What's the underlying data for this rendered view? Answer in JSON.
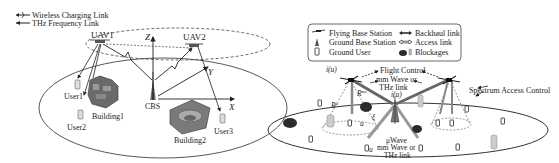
{
  "left_panel": {
    "legend": {
      "wireless_charging": "Wireless Charging Link",
      "thz_frequency": "THz Frequency Link"
    },
    "nodes": {
      "uav1": "UAV1",
      "uav2": "UAV2",
      "cbs": "CBS",
      "user1": "User1",
      "user2": "User2",
      "user3": "User3",
      "building1": "Building1",
      "building2": "Building2"
    },
    "axes": {
      "x": "X",
      "y": "Y",
      "z": "Z"
    }
  },
  "right_panel": {
    "legend": {
      "flying_base_station": "Flying Base Station",
      "ground_base_station": "Ground Base Station",
      "ground_user": "Ground User",
      "backhaul_link": "Backhaul link",
      "access_link": "Access link",
      "blockages": "Blockages"
    },
    "annotations": {
      "i_u_left": "i(u)",
      "i_u_center": "i(u)",
      "flight_control": "Flight Control",
      "mm_wave_or": "mm Wave or",
      "thz_link_top": "THz link",
      "spectrum_access_control": "Spectrum Access Control",
      "r_nu": "R",
      "r_nu_sup": "nu",
      "r_n": "R",
      "r_n_sup": "u",
      "xi": "ξ",
      "u_label_1": "u",
      "u_label_2": "u",
      "u_wave": "μWave",
      "mm_wave_or_bottom": "mm Wave or",
      "thz_link_bottom": "THz link"
    }
  },
  "colors": {
    "line": "#333333",
    "ground": "#444444",
    "building": "#6a6a6a",
    "tree": "#2b2b2b",
    "beam": "#9a9a9a"
  }
}
